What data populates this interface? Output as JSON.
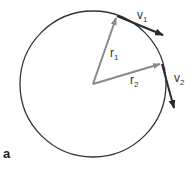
{
  "figure": {
    "panel_label": "a",
    "colors": {
      "circle": "#333333",
      "radius_vectors": "#888888",
      "velocity_vectors": "#333333"
    },
    "labels": {
      "v1": {
        "base": "v",
        "sub": "1"
      },
      "v2": {
        "base": "v",
        "sub": "2"
      },
      "r1": {
        "base": "r",
        "sub": "1"
      },
      "r2": {
        "base": "r",
        "sub": "2"
      }
    }
  }
}
